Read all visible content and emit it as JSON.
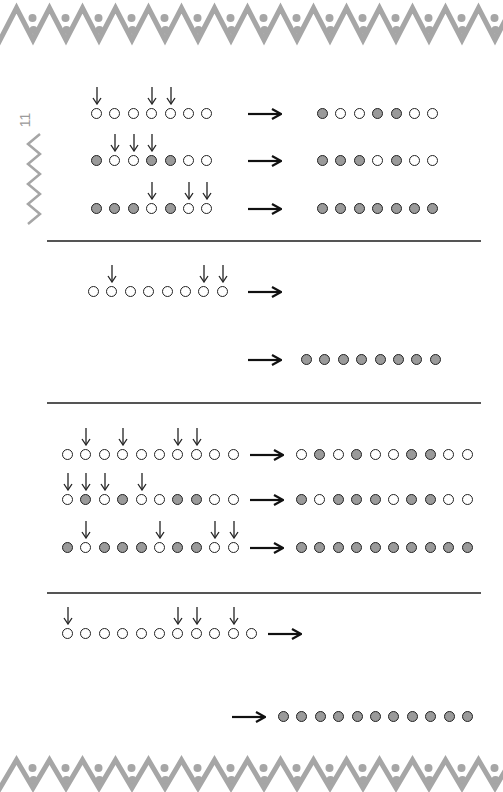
{
  "page": {
    "number": "11",
    "colors": {
      "filled": "#9a9a9a",
      "stroke": "#222222",
      "border": "#a6a6a6",
      "divider": "#555555"
    }
  },
  "sections": [
    {
      "id": "section-1",
      "rows": [
        {
          "input_y": 114,
          "input_x": 97,
          "states": [
            0,
            0,
            0,
            0,
            0,
            0,
            0
          ],
          "arrows_at": [
            0,
            3,
            4
          ],
          "arrow_x": 248,
          "output_x": 323,
          "output": [
            1,
            0,
            0,
            1,
            1,
            0,
            0
          ]
        },
        {
          "input_y": 161,
          "input_x": 97,
          "states": [
            1,
            0,
            0,
            1,
            1,
            0,
            0
          ],
          "arrows_at": [
            1,
            2,
            3
          ],
          "arrow_x": 248,
          "output_x": 323,
          "output": [
            1,
            1,
            1,
            0,
            1,
            0,
            0
          ]
        },
        {
          "input_y": 209,
          "input_x": 97,
          "states": [
            1,
            1,
            1,
            0,
            1,
            0,
            0
          ],
          "arrows_at": [
            3,
            5,
            6
          ],
          "arrow_x": 248,
          "output_x": 323,
          "output": [
            1,
            1,
            1,
            1,
            1,
            1,
            1
          ]
        }
      ]
    },
    {
      "id": "section-2",
      "rows": [
        {
          "input_y": 292,
          "input_x": 94,
          "states": [
            0,
            0,
            0,
            0,
            0,
            0,
            0,
            0
          ],
          "arrows_at": [
            1,
            6,
            7
          ],
          "arrow_x": 248,
          "output_x": null,
          "output": null
        },
        {
          "input_y": 360,
          "input_x": null,
          "states": null,
          "arrows_at": [],
          "arrow_x": 248,
          "output_x": 307,
          "output": [
            1,
            1,
            1,
            1,
            1,
            1,
            1,
            1
          ]
        }
      ]
    },
    {
      "id": "section-3",
      "rows": [
        {
          "input_y": 455,
          "input_x": 68,
          "states": [
            0,
            0,
            0,
            0,
            0,
            0,
            0,
            0,
            0,
            0
          ],
          "arrows_at": [
            1,
            3,
            6,
            7
          ],
          "arrow_x": 250,
          "output_x": 302,
          "output": [
            0,
            1,
            0,
            1,
            0,
            0,
            1,
            1,
            0,
            0
          ]
        },
        {
          "input_y": 500,
          "input_x": 68,
          "states": [
            0,
            1,
            0,
            1,
            0,
            0,
            1,
            1,
            0,
            0
          ],
          "arrows_at": [
            0,
            1,
            2,
            4
          ],
          "arrow_x": 250,
          "output_x": 302,
          "output": [
            1,
            0,
            1,
            1,
            1,
            0,
            1,
            1,
            0,
            0
          ]
        },
        {
          "input_y": 548,
          "input_x": 68,
          "states": [
            1,
            0,
            1,
            1,
            1,
            0,
            1,
            1,
            0,
            0
          ],
          "arrows_at": [
            1,
            5,
            8,
            9
          ],
          "arrow_x": 250,
          "output_x": 302,
          "output": [
            1,
            1,
            1,
            1,
            1,
            1,
            1,
            1,
            1,
            1
          ]
        }
      ]
    },
    {
      "id": "section-4",
      "rows": [
        {
          "input_y": 634,
          "input_x": 68,
          "states": [
            0,
            0,
            0,
            0,
            0,
            0,
            0,
            0,
            0,
            0,
            0
          ],
          "arrows_at": [
            0,
            6,
            7,
            9
          ],
          "arrow_x": 268,
          "output_x": null,
          "output": null
        },
        {
          "input_y": 717,
          "input_x": null,
          "states": null,
          "arrows_at": [],
          "arrow_x": 232,
          "output_x": 284,
          "output": [
            1,
            1,
            1,
            1,
            1,
            1,
            1,
            1,
            1,
            1,
            1
          ]
        }
      ]
    }
  ],
  "dividers_y": [
    240,
    402,
    592
  ],
  "dot_pitch": 18.4
}
